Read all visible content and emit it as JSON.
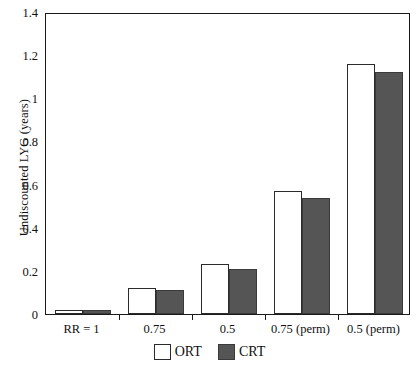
{
  "chart_data": {
    "type": "bar",
    "title": "",
    "xlabel": "",
    "ylabel": "Undiscounted LYG (years)",
    "categories": [
      "RR = 1",
      "0.75",
      "0.5",
      "0.75 (perm)",
      "0.5 (perm)"
    ],
    "series": [
      {
        "name": "ORT",
        "color": "#ffffff",
        "values": [
          0.02,
          0.12,
          0.23,
          0.57,
          1.16
        ]
      },
      {
        "name": "CRT",
        "color": "#555555",
        "values": [
          0.02,
          0.11,
          0.21,
          0.54,
          1.12
        ]
      }
    ],
    "ylim": [
      0,
      1.4
    ],
    "ytick_labels": [
      "0",
      "0.2",
      "0.4",
      "0.6",
      "0.8",
      "1",
      "1.2",
      "1.4"
    ],
    "ytick_values": [
      0,
      0.2,
      0.4,
      0.6,
      0.8,
      1.0,
      1.2,
      1.4
    ],
    "grid": false,
    "legend_position": "bottom-center"
  }
}
